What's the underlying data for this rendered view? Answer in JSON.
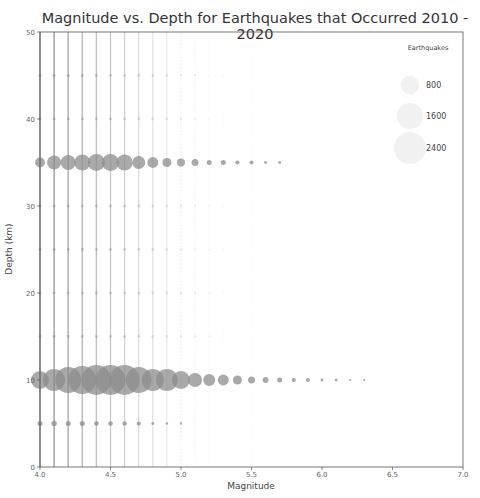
{
  "chart_data": {
    "type": "scatter",
    "title": "Magnitude vs. Depth for Earthquakes that Occurred 2010 - 2020",
    "xlabel": "Magnitude",
    "ylabel": "Depth (km)",
    "xlim": [
      4.0,
      7.0
    ],
    "ylim": [
      0,
      50
    ],
    "xticks": [
      "4.0",
      "4.5",
      "5.0",
      "5.5",
      "6.0",
      "6.5",
      "7.0"
    ],
    "xtick_values": [
      4.0,
      4.5,
      5.0,
      5.5,
      6.0,
      6.5,
      7.0
    ],
    "yticks": [
      "0",
      "10",
      "20",
      "30",
      "40",
      "50"
    ],
    "ytick_values": [
      0,
      10,
      20,
      30,
      40,
      50
    ],
    "grid": false,
    "marker_color": "#8c8c8c",
    "marker_alpha": 0.75,
    "size_encoding": "Earthquakes (count)",
    "legend": {
      "title": "Earthquakes",
      "position": "upper right",
      "entries": [
        {
          "label": "800",
          "count": 800
        },
        {
          "label": "1600",
          "count": 1600
        },
        {
          "label": "2400",
          "count": 2400
        }
      ]
    },
    "series": [
      {
        "name": "depth 10 km",
        "depth": 10,
        "magnitude": [
          4.0,
          4.1,
          4.2,
          4.3,
          4.4,
          4.5,
          4.6,
          4.7,
          4.8,
          4.9,
          5.0,
          5.1,
          5.2,
          5.3,
          5.4,
          5.5,
          5.6,
          5.7,
          5.8,
          5.9,
          6.0,
          6.1,
          6.2,
          6.3
        ],
        "count": [
          760,
          1130,
          1580,
          1830,
          2100,
          2100,
          2100,
          1580,
          1130,
          1130,
          760,
          460,
          340,
          280,
          190,
          115,
          85,
          60,
          40,
          40,
          20,
          20,
          10,
          10
        ]
      },
      {
        "name": "depth 35 km",
        "depth": 35,
        "magnitude": [
          4.0,
          4.1,
          4.2,
          4.3,
          4.4,
          4.5,
          4.6,
          4.7,
          4.8,
          4.9,
          5.0,
          5.1,
          5.2,
          5.3,
          5.4,
          5.5,
          5.6,
          5.7
        ],
        "count": [
          230,
          460,
          530,
          600,
          680,
          680,
          600,
          400,
          280,
          190,
          150,
          115,
          60,
          60,
          40,
          40,
          20,
          20
        ]
      },
      {
        "name": "depth 5 km",
        "depth": 5,
        "magnitude": [
          4.0,
          4.1,
          4.2,
          4.3,
          4.4,
          4.5,
          4.6,
          4.7,
          4.8,
          4.9,
          5.0
        ],
        "count": [
          60,
          70,
          60,
          60,
          50,
          50,
          45,
          40,
          20,
          15,
          12
        ]
      }
    ],
    "background_streaks": {
      "description": "dense columns of tiny markers at every 0.1 magnitude step spanning depths 0-50 km, fading as magnitude increases",
      "magnitude_start": 4.0,
      "magnitude_end": 6.9,
      "step": 0.1
    }
  }
}
